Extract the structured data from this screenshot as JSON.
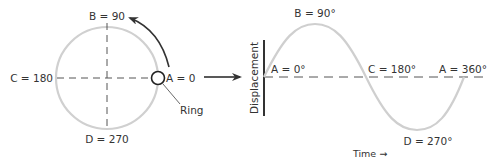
{
  "circle": {
    "labels": {
      "top": "B = 90",
      "left": "C = 180",
      "right": "A = 0",
      "bottom": "D = 270"
    },
    "ring_label": "Ring"
  },
  "wave": {
    "ylabel": "Displacement",
    "xlabel": "Time →",
    "points": {
      "start": "A = 0°",
      "peak": "B = 90°",
      "mid": "C = 180°",
      "trough": "D = 270°",
      "end": "A = 360°"
    }
  },
  "colors": {
    "curve": "#cfcfcf",
    "ink": "#333333"
  }
}
